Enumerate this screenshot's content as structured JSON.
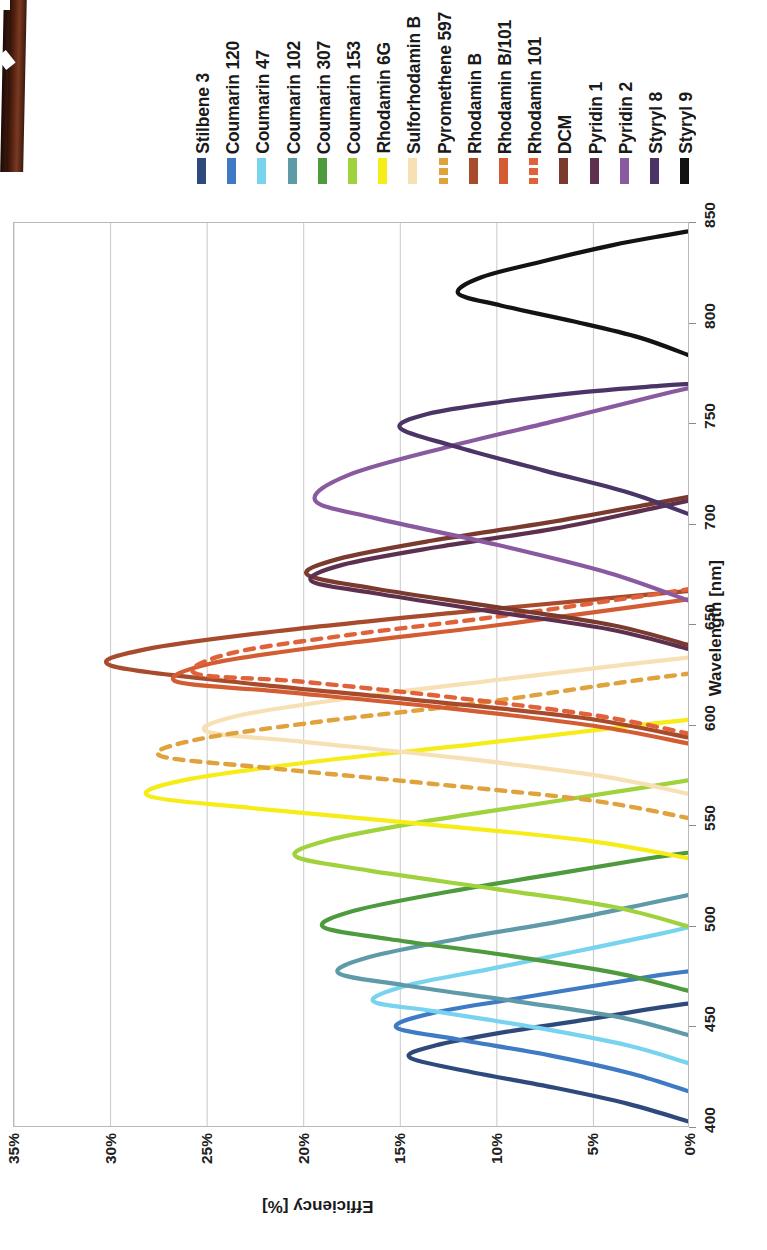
{
  "figure": {
    "orientation": "rotated-90-ccw",
    "background": "#ffffff"
  },
  "artifact": {
    "name": "scan-edge-artifact",
    "color": "#5a2413"
  },
  "chart_data": {
    "type": "line",
    "title": "",
    "xlabel": "Wavelength [nm]",
    "ylabel": "Efficiency [%]",
    "xlim": [
      400,
      850
    ],
    "ylim": [
      0,
      35
    ],
    "xticks": [
      400,
      450,
      500,
      550,
      600,
      650,
      700,
      750,
      800,
      850
    ],
    "xticklabels": [
      "400",
      "450",
      "500",
      "550",
      "600",
      "650",
      "700",
      "750",
      "800",
      "850"
    ],
    "yticks": [
      0,
      5,
      10,
      15,
      20,
      25,
      30,
      35
    ],
    "yticklabels": [
      "0%",
      "5%",
      "10%",
      "15%",
      "20%",
      "25%",
      "30%",
      "35%"
    ],
    "grid": "vertical-only",
    "legend_position": "top",
    "series": [
      {
        "name": "Stilbene 3",
        "color": "#2e4a7d",
        "style": "solid",
        "peak_x": 435,
        "peak_y": 14.5,
        "x_start": 403,
        "x_end": 462,
        "points": [
          [
            403,
            0
          ],
          [
            412,
            3.2
          ],
          [
            420,
            7.0
          ],
          [
            428,
            11.4
          ],
          [
            435,
            14.5
          ],
          [
            441,
            13.2
          ],
          [
            448,
            9.4
          ],
          [
            454,
            5.3
          ],
          [
            459,
            2.2
          ],
          [
            462,
            0
          ]
        ]
      },
      {
        "name": "Coumarin 120",
        "color": "#3e7bc4",
        "style": "solid",
        "peak_x": 450,
        "peak_y": 15.2,
        "x_start": 418,
        "x_end": 478,
        "points": [
          [
            418,
            0
          ],
          [
            427,
            3.0
          ],
          [
            436,
            7.2
          ],
          [
            444,
            12.0
          ],
          [
            450,
            15.2
          ],
          [
            457,
            13.4
          ],
          [
            464,
            9.2
          ],
          [
            471,
            4.8
          ],
          [
            476,
            1.6
          ],
          [
            478,
            0
          ]
        ]
      },
      {
        "name": "Coumarin 47",
        "color": "#77d3ee",
        "style": "solid",
        "peak_x": 463,
        "peak_y": 16.4,
        "x_start": 432,
        "x_end": 500,
        "points": [
          [
            432,
            0
          ],
          [
            441,
            3.2
          ],
          [
            450,
            8.0
          ],
          [
            458,
            13.2
          ],
          [
            463,
            16.4
          ],
          [
            471,
            14.6
          ],
          [
            479,
            10.4
          ],
          [
            488,
            5.8
          ],
          [
            496,
            1.8
          ],
          [
            500,
            0
          ]
        ]
      },
      {
        "name": "Coumarin 102",
        "color": "#5e9aa8",
        "style": "solid",
        "peak_x": 477,
        "peak_y": 18.2,
        "x_start": 446,
        "x_end": 516,
        "points": [
          [
            446,
            0
          ],
          [
            455,
            3.6
          ],
          [
            463,
            9.0
          ],
          [
            471,
            14.8
          ],
          [
            477,
            18.2
          ],
          [
            485,
            16.6
          ],
          [
            494,
            12.0
          ],
          [
            503,
            6.6
          ],
          [
            512,
            2.0
          ],
          [
            516,
            0
          ]
        ]
      },
      {
        "name": "Coumarin 307",
        "color": "#4e9a3e",
        "style": "solid",
        "peak_x": 500,
        "peak_y": 19.0,
        "x_start": 468,
        "x_end": 537,
        "points": [
          [
            468,
            0
          ],
          [
            477,
            3.8
          ],
          [
            486,
            9.6
          ],
          [
            494,
            15.6
          ],
          [
            500,
            19.0
          ],
          [
            508,
            17.4
          ],
          [
            517,
            12.8
          ],
          [
            526,
            7.2
          ],
          [
            534,
            2.2
          ],
          [
            537,
            0
          ]
        ]
      },
      {
        "name": "Coumarin 153",
        "color": "#9fd23c",
        "style": "solid",
        "peak_x": 535,
        "peak_y": 20.4,
        "x_start": 500,
        "x_end": 573,
        "points": [
          [
            500,
            0
          ],
          [
            510,
            4.0
          ],
          [
            519,
            10.2
          ],
          [
            528,
            16.6
          ],
          [
            535,
            20.4
          ],
          [
            543,
            18.8
          ],
          [
            552,
            14.0
          ],
          [
            561,
            8.0
          ],
          [
            569,
            2.6
          ],
          [
            573,
            0
          ]
        ]
      },
      {
        "name": "Rhodamin 6G",
        "color": "#f5ec18",
        "style": "solid",
        "peak_x": 565,
        "peak_y": 28.0,
        "x_start": 534,
        "x_end": 603,
        "points": [
          [
            534,
            0
          ],
          [
            543,
            5.4
          ],
          [
            551,
            13.6
          ],
          [
            559,
            22.6
          ],
          [
            565,
            28.0
          ],
          [
            573,
            26.2
          ],
          [
            582,
            19.6
          ],
          [
            591,
            11.0
          ],
          [
            600,
            3.0
          ],
          [
            603,
            0
          ]
        ]
      },
      {
        "name": "Sulforhodamin B",
        "color": "#f7e0b3",
        "style": "solid",
        "peak_x": 597,
        "peak_y": 25.0,
        "x_start": 566,
        "x_end": 634,
        "points": [
          [
            566,
            0
          ],
          [
            575,
            4.6
          ],
          [
            584,
            12.0
          ],
          [
            592,
            20.0
          ],
          [
            597,
            25.0
          ],
          [
            605,
            23.4
          ],
          [
            614,
            17.4
          ],
          [
            623,
            9.8
          ],
          [
            631,
            2.8
          ],
          [
            634,
            0
          ]
        ]
      },
      {
        "name": "Pyromethene 597",
        "color": "#e0a23c",
        "style": "dashed",
        "peak_x": 585,
        "peak_y": 27.4,
        "x_start": 554,
        "x_end": 626,
        "points": [
          [
            554,
            0
          ],
          [
            563,
            5.2
          ],
          [
            571,
            13.2
          ],
          [
            579,
            21.8
          ],
          [
            585,
            27.4
          ],
          [
            593,
            25.6
          ],
          [
            602,
            19.2
          ],
          [
            611,
            11.2
          ],
          [
            622,
            3.2
          ],
          [
            626,
            0
          ]
        ]
      },
      {
        "name": "Rhodamin B",
        "color": "#a84a2c",
        "style": "solid",
        "peak_x": 630,
        "peak_y": 30.0,
        "x_start": 594,
        "x_end": 667,
        "points": [
          [
            594,
            0
          ],
          [
            604,
            5.6
          ],
          [
            613,
            14.4
          ],
          [
            622,
            23.8
          ],
          [
            630,
            30.0
          ],
          [
            638,
            28.2
          ],
          [
            647,
            21.4
          ],
          [
            656,
            12.4
          ],
          [
            664,
            3.6
          ],
          [
            667,
            0
          ]
        ]
      },
      {
        "name": "Rhodamin B/101",
        "color": "#d35c33",
        "style": "solid",
        "peak_x": 622,
        "peak_y": 26.6,
        "x_start": 591,
        "x_end": 663,
        "points": [
          [
            591,
            0
          ],
          [
            600,
            5.0
          ],
          [
            609,
            12.8
          ],
          [
            617,
            21.2
          ],
          [
            622,
            26.6
          ],
          [
            631,
            24.8
          ],
          [
            640,
            18.6
          ],
          [
            649,
            10.8
          ],
          [
            659,
            3.0
          ],
          [
            663,
            0
          ]
        ]
      },
      {
        "name": "Rhodamin 101",
        "color": "#e0623a",
        "style": "dashed",
        "peak_x": 626,
        "peak_y": 25.6,
        "x_start": 596,
        "x_end": 668,
        "points": [
          [
            596,
            0
          ],
          [
            605,
            4.8
          ],
          [
            614,
            12.2
          ],
          [
            622,
            20.2
          ],
          [
            626,
            25.6
          ],
          [
            636,
            23.8
          ],
          [
            645,
            17.8
          ],
          [
            654,
            10.2
          ],
          [
            664,
            2.8
          ],
          [
            668,
            0
          ]
        ]
      },
      {
        "name": "DCM",
        "color": "#7b3a2e",
        "style": "solid",
        "peak_x": 675,
        "peak_y": 19.8,
        "x_start": 640,
        "x_end": 714,
        "points": [
          [
            640,
            0
          ],
          [
            650,
            4.0
          ],
          [
            659,
            10.0
          ],
          [
            668,
            16.2
          ],
          [
            675,
            19.8
          ],
          [
            683,
            18.2
          ],
          [
            692,
            13.4
          ],
          [
            701,
            7.4
          ],
          [
            710,
            2.2
          ],
          [
            714,
            0
          ]
        ]
      },
      {
        "name": "Pyridin 1",
        "color": "#5e3050",
        "style": "solid",
        "peak_x": 672,
        "peak_y": 19.6,
        "x_start": 638,
        "x_end": 712,
        "points": [
          [
            638,
            0
          ],
          [
            648,
            4.2
          ],
          [
            657,
            10.4
          ],
          [
            666,
            16.4
          ],
          [
            672,
            19.6
          ],
          [
            680,
            18.0
          ],
          [
            689,
            13.0
          ],
          [
            698,
            7.0
          ],
          [
            708,
            2.0
          ],
          [
            712,
            0
          ]
        ]
      },
      {
        "name": "Pyridin 2",
        "color": "#8a5aa0",
        "style": "solid",
        "peak_x": 712,
        "peak_y": 19.4,
        "x_start": 662,
        "x_end": 768,
        "points": [
          [
            662,
            0
          ],
          [
            676,
            4.2
          ],
          [
            690,
            10.0
          ],
          [
            703,
            16.2
          ],
          [
            712,
            19.4
          ],
          [
            725,
            17.6
          ],
          [
            739,
            12.4
          ],
          [
            752,
            6.8
          ],
          [
            764,
            1.8
          ],
          [
            768,
            0
          ]
        ]
      },
      {
        "name": "Styryl 8",
        "color": "#4a3566",
        "style": "solid",
        "peak_x": 748,
        "peak_y": 15.0,
        "x_start": 705,
        "x_end": 770,
        "points": [
          [
            705,
            0
          ],
          [
            716,
            3.2
          ],
          [
            727,
            7.6
          ],
          [
            739,
            12.2
          ],
          [
            748,
            15.0
          ],
          [
            755,
            13.6
          ],
          [
            761,
            9.8
          ],
          [
            766,
            5.4
          ],
          [
            769,
            1.6
          ],
          [
            770,
            0
          ]
        ]
      },
      {
        "name": "Styryl 9",
        "color": "#131313",
        "style": "solid",
        "peak_x": 815,
        "peak_y": 12.0,
        "x_start": 784,
        "x_end": 846,
        "points": [
          [
            784,
            0
          ],
          [
            793,
            2.6
          ],
          [
            801,
            6.0
          ],
          [
            809,
            9.8
          ],
          [
            815,
            12.0
          ],
          [
            823,
            10.8
          ],
          [
            831,
            7.6
          ],
          [
            839,
            4.0
          ],
          [
            844,
            1.2
          ],
          [
            846,
            0
          ]
        ]
      }
    ]
  }
}
